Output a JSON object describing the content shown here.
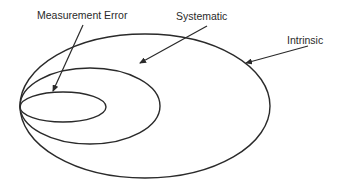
{
  "diagram": {
    "type": "nested-ellipses",
    "stroke_color": "#2a2a2a",
    "background": "#ffffff",
    "ellipses": [
      {
        "id": "intrinsic",
        "cx": 145,
        "cy": 106,
        "rx": 125,
        "ry": 72
      },
      {
        "id": "systematic",
        "cx": 90,
        "cy": 106,
        "rx": 70,
        "ry": 38
      },
      {
        "id": "measurement-error",
        "cx": 63,
        "cy": 107,
        "rx": 43,
        "ry": 15
      }
    ],
    "labels": {
      "measurement_error": "Measurement Error",
      "systematic": "Systematic",
      "intrinsic": "Intrinsic"
    },
    "arrows": [
      {
        "from": "Measurement Error",
        "to": "measurement-error ellipse",
        "x1": 83,
        "y1": 25,
        "x2": 53,
        "y2": 91
      },
      {
        "from": "Systematic",
        "to": "systematic ellipse",
        "x1": 207,
        "y1": 26,
        "x2": 140,
        "y2": 63
      },
      {
        "from": "Intrinsic",
        "to": "intrinsic ellipse",
        "x1": 308,
        "y1": 46,
        "x2": 246,
        "y2": 63
      }
    ]
  }
}
